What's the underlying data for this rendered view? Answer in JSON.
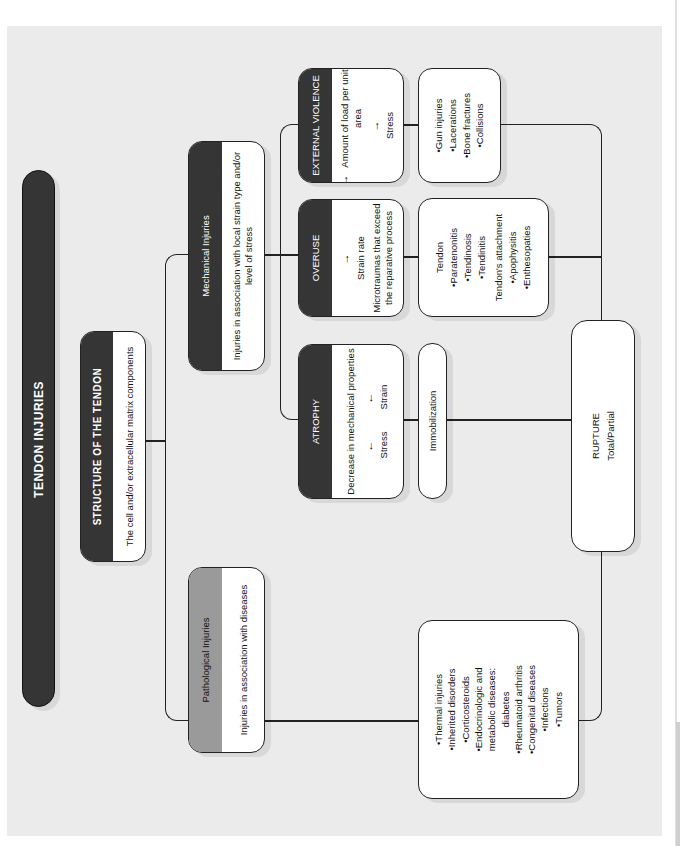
{
  "title": "TENDON INJURIES",
  "structure": {
    "heading": "STRUCTURE OF THE TENDON",
    "description": "The cell and/or extracellular matrix components"
  },
  "mechanical": {
    "heading": "Mechanical Injuries",
    "description": "Injuries in association with local strain type and/or level of stress"
  },
  "pathological": {
    "heading": "Pathological Injuries",
    "description": "Injuries in association with diseases"
  },
  "atrophy": {
    "heading": "ATROPHY",
    "line1": "Decrease in mechanical properties",
    "stress": "Stress",
    "strain": "Strain",
    "stress_arrow": "down",
    "strain_arrow": "down"
  },
  "overuse": {
    "heading": "OVERUSE",
    "strain_rate": "Strain rate",
    "strain_rate_arrow": "up",
    "line2": "Microtraumas that exceed the reparative process"
  },
  "external": {
    "heading": "EXTERNAL VIOLENCE",
    "line1": "Amount of load per unit area",
    "line1_arrow": "up",
    "stress": "Stress",
    "stress_arrow": "up"
  },
  "immobilization": {
    "label": "Immobilization"
  },
  "overuse_list": {
    "group1_title": "Tendon",
    "group1_items": [
      "•Paratenonitis",
      "•Tendinosis",
      "•Tendinitis"
    ],
    "group2_title": "Tendon's attachment",
    "group2_items": [
      "•Apophysitis",
      "•Enthesopaties"
    ]
  },
  "external_list": {
    "items": [
      "•Gun injuries",
      "•Lacerations",
      "•Bone fractures",
      "•Collisions"
    ]
  },
  "disease_list": {
    "items": [
      "•Thermal injuries",
      "•Inherited disorders",
      "•Corticosteroids",
      "•Endocrinologic and metabolic diseases: diabetes",
      "•Rheumatoid arthritis",
      "•Congenital diseases",
      "•Infections",
      "•Tumors"
    ]
  },
  "rupture": {
    "heading": "RUPTURE",
    "subtitle": "Total/Partial"
  },
  "colors": {
    "dark_header": "#353535",
    "gray_header": "#9a9a9a",
    "background": "#ebebeb",
    "box": "#ffffff",
    "line": "#222222"
  }
}
